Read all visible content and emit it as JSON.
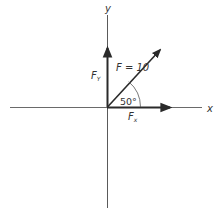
{
  "diagram": {
    "axes": {
      "x_label": "x",
      "y_label": "y"
    },
    "vectors": {
      "resultant": {
        "name": "F",
        "label": "F = 10",
        "magnitude": 10,
        "angle_deg": 50
      },
      "x_component": {
        "label_main": "F",
        "label_sub": "x"
      },
      "y_component": {
        "label_main": "F",
        "label_sub": "Y"
      }
    },
    "angle": {
      "label": "50°",
      "value_deg": 50
    },
    "colors": {
      "axis": "#5a5a5a",
      "vector": "#2a2a2a",
      "text": "#333333"
    }
  }
}
